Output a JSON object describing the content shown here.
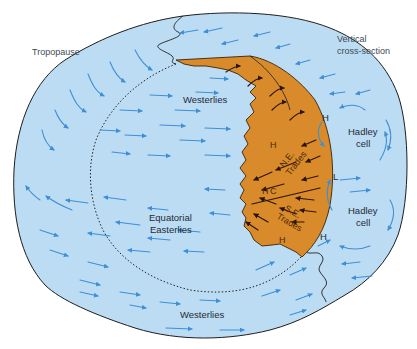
{
  "diagram": {
    "type": "atmospheric-general-circulation",
    "colors": {
      "atmosphere_fill": "#bcdcf4",
      "atmosphere_outline": "#1d1d1d",
      "trade_band_fill": "#d98a2b",
      "wind_arrow": "#3d8fd6",
      "band_arrow": "#2a1505",
      "text": "#1f2a33"
    },
    "labels": {
      "tropopause": "Tropopause",
      "vertical_cross_section_line1": "Vertical",
      "vertical_cross_section_line2": "cross-section",
      "westerlies_north": "Westerlies",
      "westerlies_south": "Westerlies",
      "equatorial_easterlies_line1": "Equatorial",
      "equatorial_easterlies_line2": "Easterlies",
      "ne_trades_line1": "N.E.",
      "ne_trades_line2": "Trades",
      "se_trades_line1": "S.E.",
      "se_trades_line2": "Trades",
      "itc": "ITC",
      "hadley_cell_north_line1": "Hadley",
      "hadley_cell_north_line2": "cell",
      "hadley_cell_south_line1": "Hadley",
      "hadley_cell_south_line2": "cell",
      "high_band_north": "H",
      "high_band_south": "H",
      "high_section_north": "H",
      "high_section_south": "H",
      "low_section": "L"
    }
  }
}
